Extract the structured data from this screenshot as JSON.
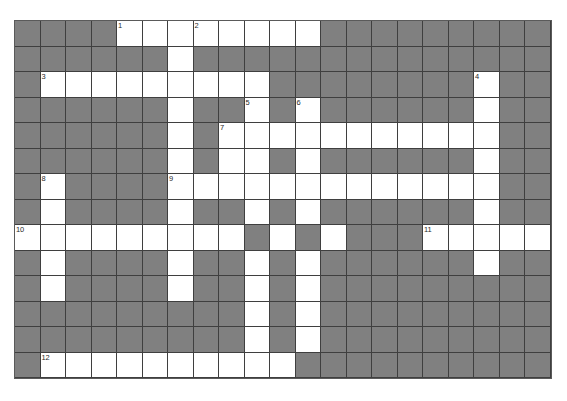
{
  "puzzle": {
    "title": "Crossword Puzzle Grid",
    "kind": "crossword-grid",
    "columns": 21,
    "rows": 14,
    "cell_size_px": 25.5,
    "origin_x_px": 15,
    "origin_y_px": 21,
    "colors": {
      "block": "#808080",
      "open": "#ffffff",
      "grid_line": "#3f3f3f",
      "page_background": "#ffffff",
      "clue_number_text": "#2a2a2a"
    },
    "clue_numbers_visible": [
      "1",
      "2",
      "3",
      "4",
      "5",
      "6",
      "7",
      "8",
      "9",
      "10",
      "11",
      "12"
    ],
    "numbered_cells": [
      {
        "number": "1",
        "row": 0,
        "col": 4
      },
      {
        "number": "2",
        "row": 0,
        "col": 7
      },
      {
        "number": "3",
        "row": 2,
        "col": 1
      },
      {
        "number": "4",
        "row": 2,
        "col": 18
      },
      {
        "number": "5",
        "row": 3,
        "col": 9
      },
      {
        "number": "6",
        "row": 3,
        "col": 11
      },
      {
        "number": "7",
        "row": 4,
        "col": 8
      },
      {
        "number": "8",
        "row": 6,
        "col": 1
      },
      {
        "number": "9",
        "row": 6,
        "col": 6
      },
      {
        "number": "10",
        "row": 8,
        "col": 0
      },
      {
        "number": "11",
        "row": 8,
        "col": 16
      },
      {
        "number": "12",
        "row": 13,
        "col": 1
      }
    ],
    "grid": [
      [
        0,
        0,
        0,
        0,
        1,
        1,
        1,
        1,
        1,
        1,
        1,
        1,
        0,
        0,
        0,
        0,
        0,
        0,
        0,
        0,
        0
      ],
      [
        0,
        0,
        0,
        0,
        0,
        0,
        1,
        0,
        0,
        0,
        0,
        0,
        0,
        0,
        0,
        0,
        0,
        0,
        0,
        0,
        0
      ],
      [
        0,
        1,
        1,
        1,
        1,
        1,
        1,
        1,
        1,
        1,
        0,
        0,
        0,
        0,
        0,
        0,
        0,
        0,
        1,
        0,
        0
      ],
      [
        0,
        0,
        0,
        0,
        0,
        0,
        1,
        0,
        0,
        1,
        0,
        1,
        0,
        0,
        0,
        0,
        0,
        0,
        1,
        0,
        0
      ],
      [
        0,
        0,
        0,
        0,
        0,
        0,
        1,
        0,
        1,
        1,
        1,
        1,
        1,
        1,
        1,
        1,
        1,
        1,
        1,
        0,
        0
      ],
      [
        0,
        0,
        0,
        0,
        0,
        0,
        1,
        0,
        1,
        1,
        0,
        1,
        0,
        0,
        0,
        0,
        0,
        0,
        1,
        0,
        0
      ],
      [
        0,
        1,
        0,
        0,
        0,
        0,
        1,
        1,
        1,
        1,
        1,
        1,
        1,
        1,
        1,
        1,
        1,
        1,
        1,
        0,
        0
      ],
      [
        0,
        1,
        0,
        0,
        0,
        0,
        1,
        0,
        0,
        1,
        0,
        1,
        0,
        0,
        0,
        0,
        0,
        0,
        1,
        0,
        0
      ],
      [
        1,
        1,
        1,
        1,
        1,
        1,
        1,
        1,
        1,
        0,
        1,
        0,
        1,
        0,
        0,
        0,
        1,
        1,
        1,
        1,
        1
      ],
      [
        0,
        1,
        0,
        0,
        0,
        0,
        1,
        0,
        0,
        1,
        0,
        1,
        0,
        0,
        0,
        0,
        0,
        0,
        1,
        0,
        0
      ],
      [
        0,
        1,
        0,
        0,
        0,
        0,
        1,
        0,
        0,
        1,
        0,
        1,
        0,
        0,
        0,
        0,
        0,
        0,
        0,
        0,
        0
      ],
      [
        0,
        0,
        0,
        0,
        0,
        0,
        0,
        0,
        0,
        1,
        0,
        1,
        0,
        0,
        0,
        0,
        0,
        0,
        0,
        0,
        0
      ],
      [
        0,
        0,
        0,
        0,
        0,
        0,
        0,
        0,
        0,
        1,
        0,
        1,
        0,
        0,
        0,
        0,
        0,
        0,
        0,
        0,
        0
      ],
      [
        0,
        1,
        1,
        1,
        1,
        1,
        1,
        1,
        1,
        1,
        1,
        0,
        0,
        0,
        0,
        0,
        0,
        0,
        0,
        0,
        0
      ]
    ]
  }
}
